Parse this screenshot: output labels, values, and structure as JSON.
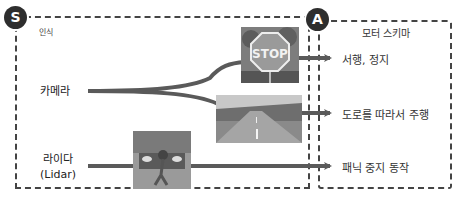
{
  "diagram": {
    "sensing_box": {
      "badge": "S",
      "title": "인식",
      "sources": [
        {
          "label": "카메라"
        },
        {
          "label_line1": "라이다",
          "label_line2": "(Lidar)"
        }
      ]
    },
    "action_box": {
      "badge": "A",
      "title": "모터 스키마",
      "outputs": [
        {
          "label": "서행, 정지"
        },
        {
          "label": "도로를 따라서 주행"
        },
        {
          "label": "패닉 중지 동작"
        }
      ]
    },
    "images": [
      {
        "name": "stop-sign-photo",
        "sign_text": "STOP"
      },
      {
        "name": "road-photo"
      },
      {
        "name": "pedestrian-photo"
      }
    ],
    "colors": {
      "line": "#5a5a5a",
      "badge": "#2e2e2e",
      "border": "#444444",
      "stop_sign": "#8a8a8a"
    }
  }
}
